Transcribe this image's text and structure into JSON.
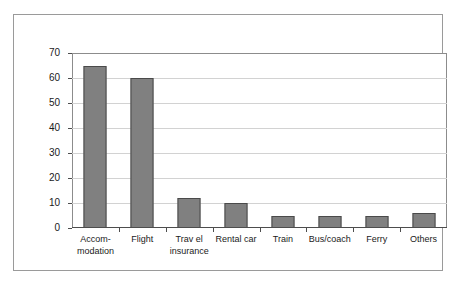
{
  "chart_data": {
    "type": "bar",
    "title": "",
    "subtitle": "",
    "xlabel": "",
    "ylabel": "",
    "categories": [
      "Accom-\nmodation",
      "Flight",
      "Trav el\ninsurance",
      "Rental car",
      "Train",
      "Bus/coach",
      "Ferry",
      "Others"
    ],
    "values": [
      65,
      60,
      12,
      10,
      5,
      5,
      5,
      6
    ],
    "ylim": [
      0,
      70
    ],
    "ytick_step": 10,
    "yticks": [
      "70",
      "60",
      "50",
      "40",
      "30",
      "20",
      "10",
      "0"
    ],
    "ytick_values": [
      70,
      60,
      50,
      40,
      30,
      20,
      10,
      0
    ],
    "grid": true,
    "legend": false,
    "legend_position": "none",
    "bar_color": "#808080",
    "bar_border_color": "#4a4a4a",
    "gridline_color": "#d2d2d2",
    "axis_color": "#4d4d4d",
    "frame_color": "#9a9a9a",
    "background": "#ffffff"
  }
}
